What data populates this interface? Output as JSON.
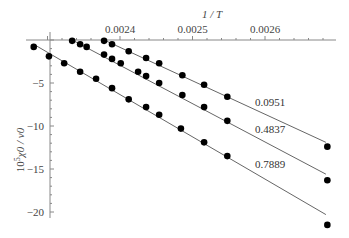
{
  "chart_data": {
    "type": "scatter",
    "title": "",
    "xlabel": "1 / T",
    "ylabel": "10^5 χ0 / v0",
    "xlim": [
      0.00227,
      0.00273
    ],
    "ylim": [
      -22,
      1
    ],
    "grid": false,
    "legend": "inline labels at right",
    "x_ticks": [
      0.0024,
      0.0025,
      0.0026
    ],
    "x_tick_labels": [
      "0.0024",
      "0.0025",
      "0.0026"
    ],
    "y_ticks": [
      -5,
      -10,
      -15,
      -20
    ],
    "y_tick_labels": [
      "-5",
      "-10",
      "-15",
      "-20"
    ],
    "series": [
      {
        "name": "0.0951",
        "x": [
          0.002378,
          0.002389,
          0.002412,
          0.002436,
          0.002454,
          0.002486,
          0.002516,
          0.002548,
          0.002686
        ],
        "y": [
          -0.1,
          -0.5,
          -1.3,
          -2.1,
          -2.7,
          -4.1,
          -5.2,
          -6.6,
          -12.4
        ],
        "fit": {
          "x": [
            0.002378,
            0.002684
          ],
          "y": [
            0.0,
            -11.9
          ]
        }
      },
      {
        "name": "0.4837",
        "x": [
          0.002334,
          0.002345,
          0.002354,
          0.002378,
          0.002389,
          0.002401,
          0.002425,
          0.002436,
          0.002454,
          0.002486,
          0.002516,
          0.002548,
          0.002686
        ],
        "y": [
          -0.1,
          -0.5,
          -0.8,
          -1.7,
          -2.2,
          -2.7,
          -3.7,
          -4.2,
          -5.0,
          -6.4,
          -7.8,
          -9.4,
          -16.3
        ],
        "fit": {
          "x": [
            0.002334,
            0.002684
          ],
          "y": [
            0.0,
            -15.6
          ]
        }
      },
      {
        "name": "0.7889",
        "x": [
          0.002281,
          0.002302,
          0.002323,
          0.002345,
          0.002367,
          0.002389,
          0.002412,
          0.002436,
          0.002454,
          0.002484,
          0.002516,
          0.002548,
          0.002686
        ],
        "y": [
          -0.8,
          -1.9,
          -2.7,
          -3.7,
          -4.5,
          -5.6,
          -6.9,
          -7.8,
          -8.7,
          -10.3,
          -11.9,
          -13.5,
          -21.5
        ],
        "fit": {
          "x": [
            0.002281,
            0.002684
          ],
          "y": [
            -0.5,
            -20.3
          ]
        }
      }
    ]
  }
}
